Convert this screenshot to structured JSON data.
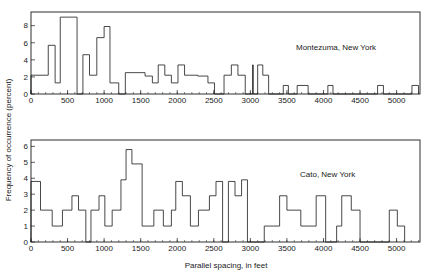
{
  "figure": {
    "ylabel": "Frequency of occurrence (percent)",
    "xlabel": "Parallel spacing, in feet",
    "line_color": "#1a1a1a",
    "background": "#ffffff"
  },
  "chart_data": [
    {
      "type": "bar",
      "title": "Montezuma, New York",
      "annotation": "Montezuma, New York",
      "xlabel": "Parallel spacing, in feet",
      "ylabel": "Frequency of occurrence (percent)",
      "xlim": [
        0,
        5320
      ],
      "ylim": [
        0,
        9.6
      ],
      "xticks": [
        0,
        500,
        1000,
        1500,
        2000,
        2500,
        3000,
        3500,
        4000,
        4500,
        5000
      ],
      "xticklabels": [
        "0",
        "500",
        "1000",
        "1500",
        "2000",
        "2500",
        "3000",
        "3500",
        "4000",
        "4500",
        "5000"
      ],
      "xminor_step": 100,
      "yticks": [
        0,
        2,
        4,
        6,
        8
      ],
      "yticklabels": [
        "0",
        "2",
        "4",
        "6",
        "8"
      ],
      "grid": false,
      "legend": "none",
      "bin_width": 80,
      "bin_starts": [
        0,
        80,
        160,
        240,
        320,
        400,
        480,
        560,
        640,
        720,
        800,
        880,
        960,
        1040,
        1120,
        1200,
        1280,
        1360,
        1440,
        1520,
        1600,
        1680,
        1760,
        1840,
        1920,
        2000,
        2080,
        2160,
        2240,
        2320,
        2400,
        2480,
        2560,
        2640,
        2720,
        2800,
        2880,
        2960,
        3040,
        3120,
        3200,
        3280,
        3360,
        3440,
        3520,
        3600,
        3680,
        3760,
        3840,
        3920,
        4000,
        4080,
        4160,
        4240,
        4320,
        4400,
        4480,
        4560,
        4640,
        4720,
        4800,
        4880,
        4960,
        5040,
        5120,
        5200
      ],
      "values": [
        2.2,
        2.2,
        2.2,
        5.7,
        5.7,
        1.3,
        9.0,
        9.0,
        9.0,
        0.0,
        4.6,
        2.2,
        2.2,
        6.6,
        7.9,
        1.3,
        1.3,
        2.5,
        2.5,
        2.5,
        2.5,
        1.3,
        3.4,
        1.3,
        1.3,
        3.5,
        2.0,
        2.0,
        2.0,
        1.3,
        0.0,
        0.0,
        2.2,
        2.2,
        3.4,
        2.2,
        2.2,
        0.0,
        3.4,
        2.2,
        0.0,
        1.0,
        0.0,
        0.0,
        1.0,
        1.0,
        0.0,
        0.0,
        0.0,
        0.0,
        1.0,
        0.0,
        0.0,
        0.0,
        0.0,
        0.0,
        0.0,
        0.0,
        0.0,
        1.0,
        0.0,
        0.0,
        0.0,
        0.0,
        1.0,
        1.0
      ],
      "polyline_points": [
        [
          0,
          0
        ],
        [
          0,
          2.2
        ],
        [
          236,
          2.2
        ],
        [
          236,
          5.7
        ],
        [
          330,
          5.7
        ],
        [
          330,
          1.3
        ],
        [
          400,
          1.3
        ],
        [
          400,
          9.0
        ],
        [
          560,
          9.0
        ],
        [
          630,
          9.0
        ],
        [
          630,
          0
        ],
        [
          710,
          0
        ],
        [
          710,
          4.6
        ],
        [
          800,
          4.6
        ],
        [
          800,
          2.2
        ],
        [
          900,
          2.2
        ],
        [
          900,
          6.6
        ],
        [
          1000,
          6.6
        ],
        [
          1000,
          7.9
        ],
        [
          1080,
          7.9
        ],
        [
          1080,
          1.3
        ],
        [
          1200,
          1.3
        ],
        [
          1200,
          0
        ],
        [
          1290,
          0
        ],
        [
          1290,
          2.5
        ],
        [
          1560,
          2.5
        ],
        [
          1560,
          2.1
        ],
        [
          1660,
          2.1
        ],
        [
          1660,
          1.3
        ],
        [
          1740,
          1.3
        ],
        [
          1740,
          3.4
        ],
        [
          1830,
          3.4
        ],
        [
          1830,
          2.2
        ],
        [
          1920,
          2.2
        ],
        [
          1920,
          1.3
        ],
        [
          2010,
          1.3
        ],
        [
          2010,
          3.4
        ],
        [
          2100,
          3.4
        ],
        [
          2100,
          2.2
        ],
        [
          2280,
          2.2
        ],
        [
          2280,
          2.1
        ],
        [
          2420,
          2.1
        ],
        [
          2420,
          1.3
        ],
        [
          2510,
          1.3
        ],
        [
          2510,
          0
        ],
        [
          2640,
          0
        ],
        [
          2640,
          2.2
        ],
        [
          2740,
          2.2
        ],
        [
          2740,
          3.4
        ],
        [
          2830,
          3.4
        ],
        [
          2830,
          2.2
        ],
        [
          2930,
          2.2
        ],
        [
          2930,
          0
        ],
        [
          3030,
          0
        ],
        [
          3030,
          3.4
        ],
        [
          3040,
          3.4
        ],
        [
          3040,
          0
        ],
        [
          3100,
          0
        ],
        [
          3100,
          3.4
        ],
        [
          3170,
          3.4
        ],
        [
          3170,
          2.2
        ],
        [
          3250,
          2.2
        ],
        [
          3250,
          0
        ],
        [
          3450,
          0
        ],
        [
          3450,
          1.0
        ],
        [
          3520,
          1.0
        ],
        [
          3520,
          0
        ],
        [
          3640,
          0
        ],
        [
          3640,
          1.0
        ],
        [
          3790,
          1.0
        ],
        [
          3790,
          0
        ],
        [
          4060,
          0
        ],
        [
          4060,
          1.0
        ],
        [
          4130,
          1.0
        ],
        [
          4130,
          0
        ],
        [
          4740,
          0
        ],
        [
          4740,
          1.0
        ],
        [
          4820,
          1.0
        ],
        [
          4820,
          0
        ],
        [
          5210,
          0
        ],
        [
          5210,
          1.0
        ],
        [
          5300,
          1.0
        ],
        [
          5300,
          0
        ]
      ]
    },
    {
      "type": "bar",
      "title": "Cato, New York",
      "annotation": "Cato, New York",
      "xlabel": "Parallel spacing, in feet",
      "ylabel": "Frequency of occurrence (percent)",
      "xlim": [
        0,
        5320
      ],
      "ylim": [
        0,
        6.4
      ],
      "xticks": [
        0,
        500,
        1000,
        1500,
        2000,
        2500,
        3000,
        3500,
        4000,
        4500,
        5000
      ],
      "xticklabels": [
        "0",
        "500",
        "1000",
        "1500",
        "2000",
        "2500",
        "3000",
        "3500",
        "4000",
        "4500",
        "5000"
      ],
      "xminor_step": 100,
      "yticks": [
        0,
        1,
        2,
        3,
        4,
        5,
        6
      ],
      "yticklabels": [
        "0",
        "1",
        "2",
        "3",
        "4",
        "5",
        "6"
      ],
      "grid": false,
      "legend": "none",
      "bin_width": 80,
      "bin_starts": [
        0,
        80,
        160,
        240,
        320,
        400,
        480,
        560,
        640,
        720,
        800,
        880,
        960,
        1040,
        1120,
        1200,
        1280,
        1360,
        1440,
        1520,
        1600,
        1680,
        1760,
        1840,
        1920,
        2000,
        2080,
        2160,
        2240,
        2320,
        2400,
        2480,
        2560,
        2640,
        2720,
        2800,
        2880,
        2960,
        3040,
        3120,
        3200,
        3280,
        3360,
        3440,
        3520,
        3600,
        3680,
        3760,
        3840,
        3920,
        4000,
        4080,
        4160,
        4240,
        4320,
        4400,
        4480,
        4560,
        4640,
        4720,
        4800,
        4880,
        4960,
        5040,
        5120,
        5200
      ],
      "values": [
        3.8,
        3.8,
        2.0,
        2.0,
        1.0,
        2.0,
        2.0,
        2.9,
        2.9,
        2.0,
        0.0,
        2.0,
        2.9,
        1.0,
        2.0,
        2.0,
        3.9,
        5.8,
        4.9,
        4.9,
        1.0,
        2.0,
        1.0,
        2.0,
        3.8,
        3.8,
        2.9,
        1.0,
        2.0,
        2.9,
        3.8,
        0.0,
        3.8,
        2.9,
        3.9,
        0.0,
        0.0,
        1.0,
        2.9,
        2.0,
        2.0,
        2.9,
        0.0,
        1.0,
        2.9,
        2.0,
        0.0,
        0.0,
        2.0,
        1.0,
        0.0,
        0.0
      ],
      "polyline_points": [
        [
          0,
          0
        ],
        [
          0,
          3.8
        ],
        [
          130,
          3.8
        ],
        [
          130,
          2.0
        ],
        [
          290,
          2.0
        ],
        [
          290,
          1.0
        ],
        [
          430,
          1.0
        ],
        [
          430,
          2.0
        ],
        [
          560,
          2.0
        ],
        [
          560,
          2.9
        ],
        [
          650,
          2.9
        ],
        [
          650,
          2.0
        ],
        [
          750,
          2.0
        ],
        [
          750,
          0
        ],
        [
          820,
          0
        ],
        [
          820,
          2.0
        ],
        [
          930,
          2.0
        ],
        [
          930,
          2.9
        ],
        [
          1010,
          2.9
        ],
        [
          1010,
          1.0
        ],
        [
          1110,
          1.0
        ],
        [
          1110,
          2.0
        ],
        [
          1230,
          2.0
        ],
        [
          1230,
          3.9
        ],
        [
          1300,
          3.9
        ],
        [
          1300,
          5.8
        ],
        [
          1380,
          5.8
        ],
        [
          1380,
          4.9
        ],
        [
          1520,
          4.9
        ],
        [
          1520,
          1.0
        ],
        [
          1680,
          1.0
        ],
        [
          1680,
          2.0
        ],
        [
          1810,
          2.0
        ],
        [
          1810,
          1.0
        ],
        [
          1920,
          1.0
        ],
        [
          1920,
          2.0
        ],
        [
          1980,
          2.0
        ],
        [
          1980,
          3.8
        ],
        [
          2070,
          3.8
        ],
        [
          2070,
          2.9
        ],
        [
          2180,
          2.9
        ],
        [
          2180,
          1.0
        ],
        [
          2290,
          1.0
        ],
        [
          2290,
          2.0
        ],
        [
          2440,
          2.0
        ],
        [
          2440,
          2.9
        ],
        [
          2530,
          2.9
        ],
        [
          2530,
          3.8
        ],
        [
          2620,
          3.8
        ],
        [
          2620,
          0
        ],
        [
          2700,
          0
        ],
        [
          2700,
          3.8
        ],
        [
          2790,
          3.8
        ],
        [
          2790,
          2.9
        ],
        [
          2880,
          2.9
        ],
        [
          2880,
          3.9
        ],
        [
          2960,
          3.9
        ],
        [
          2960,
          0
        ],
        [
          3190,
          0
        ],
        [
          3190,
          1.0
        ],
        [
          3400,
          1.0
        ],
        [
          3400,
          2.9
        ],
        [
          3500,
          2.9
        ],
        [
          3500,
          2.0
        ],
        [
          3690,
          2.0
        ],
        [
          3690,
          1.0
        ],
        [
          3900,
          1.0
        ],
        [
          3900,
          2.9
        ],
        [
          4030,
          2.9
        ],
        [
          4030,
          0
        ],
        [
          4180,
          0
        ],
        [
          4180,
          1.0
        ],
        [
          4250,
          1.0
        ],
        [
          4250,
          2.9
        ],
        [
          4380,
          2.9
        ],
        [
          4380,
          2.0
        ],
        [
          4500,
          2.0
        ],
        [
          4500,
          0
        ],
        [
          4900,
          0
        ],
        [
          4900,
          2.0
        ],
        [
          5010,
          2.0
        ],
        [
          5010,
          1.0
        ],
        [
          5110,
          1.0
        ],
        [
          5110,
          0
        ]
      ]
    }
  ]
}
